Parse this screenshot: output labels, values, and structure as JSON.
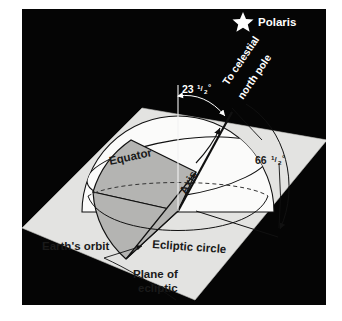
{
  "figure": {
    "kind": "astronomy-diagram",
    "title_visible": false,
    "background_color": "#050505",
    "plane_color": "#e3e3e1",
    "dome_color": "#fbfbfa",
    "wedge_color": "#b4b4b2",
    "line_color": "#111111",
    "text_light_color": "#ffffff",
    "text_dark_color": "#1a1a1a"
  },
  "labels": {
    "polaris": "Polaris",
    "to_celestial_pole_line1": "To celestial",
    "to_celestial_pole_line2": "north pole",
    "axis_tilt_value": "23",
    "axis_tilt_fraction_numerator": "1",
    "axis_tilt_fraction_denominator": "2",
    "axis_tilt_degree": "°",
    "pole_angle_value": "66",
    "pole_angle_fraction_numerator": "1",
    "pole_angle_fraction_denominator": "2",
    "pole_angle_degree": "°",
    "equator": "Equator",
    "axis": "Axis",
    "earths_orbit": "Earth's orbit",
    "ecliptic_circle": "Ecliptic circle",
    "plane_of_ecliptic_line1": "Plane of",
    "plane_of_ecliptic_line2": "ecliptic"
  },
  "icons": {
    "polaris_star": "star-icon"
  },
  "diagram_data": {
    "type": "diagram",
    "subject": "Earth's axial tilt relative to the plane of the ecliptic",
    "angles": [
      {
        "name": "axis tilt from vertical",
        "label": "23 1/2°",
        "degrees": 23.5
      },
      {
        "name": "axis to plane of ecliptic",
        "label": "66 1/2°",
        "degrees": 66.5
      }
    ],
    "elements": [
      "Polaris star",
      "direction to celestial north pole",
      "Earth hemisphere with cut wedge",
      "Equator band",
      "rotation axis",
      "Ecliptic circle",
      "Earth's orbit",
      "Plane of ecliptic"
    ]
  }
}
